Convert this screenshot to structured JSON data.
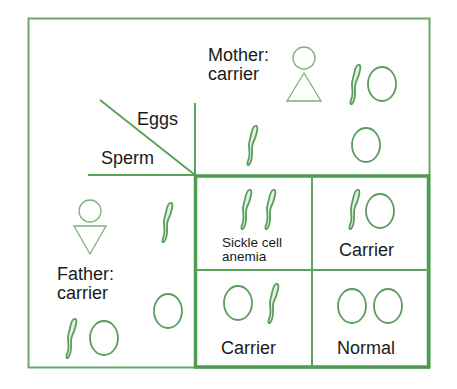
{
  "colors": {
    "line": "#5aa35a",
    "cell_stroke": "#4e9a4e",
    "symbol": "#5c9d5c",
    "text": "#1a1a1a"
  },
  "headers": {
    "eggs": "Eggs",
    "sperm": "Sperm"
  },
  "mother": {
    "label_line1": "Mother:",
    "label_line2": "carrier",
    "symbol": "female-symbol",
    "genotype": [
      "sickle-cell",
      "normal-cell"
    ]
  },
  "father": {
    "label_line1": "Father:",
    "label_line2": "carrier",
    "symbol": "male-symbol",
    "genotype": [
      "sickle-cell",
      "normal-cell"
    ]
  },
  "eggs_columns": [
    "sickle-cell",
    "normal-cell"
  ],
  "sperm_rows": [
    "sickle-cell",
    "normal-cell"
  ],
  "cells": [
    {
      "label_line1": "Sickle cell",
      "label_line2": "anemia",
      "cells": [
        "sickle-cell",
        "sickle-cell"
      ]
    },
    {
      "label_line1": "Carrier",
      "label_line2": "",
      "cells": [
        "sickle-cell",
        "normal-cell"
      ]
    },
    {
      "label_line1": "Carrier",
      "label_line2": "",
      "cells": [
        "normal-cell",
        "sickle-cell"
      ]
    },
    {
      "label_line1": "Normal",
      "label_line2": "",
      "cells": [
        "normal-cell",
        "normal-cell"
      ]
    }
  ]
}
